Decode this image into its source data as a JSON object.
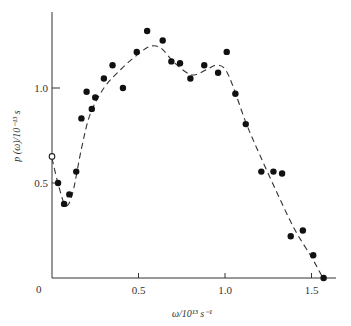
{
  "chart_data": {
    "type": "scatter",
    "title": "",
    "xlabel": "ω/10¹³ s⁻¹",
    "ylabel": "p (ω)/10⁻¹³ s",
    "xlim": [
      0,
      1.6
    ],
    "ylim": [
      0,
      1.35
    ],
    "x_ticks": [
      0.5,
      1.0,
      1.5
    ],
    "x_tick_labels": [
      "0.5",
      "1.0",
      "1.5"
    ],
    "y_ticks": [
      0.5,
      1.0
    ],
    "y_tick_labels": [
      "0.5",
      "1.0"
    ],
    "origin_label": "0",
    "grid": false,
    "legend": null,
    "series": [
      {
        "name": "measured (filled)",
        "style": "filled-circle",
        "points": [
          [
            0.035,
            0.5
          ],
          [
            0.07,
            0.39
          ],
          [
            0.1,
            0.44
          ],
          [
            0.14,
            0.56
          ],
          [
            0.17,
            0.84
          ],
          [
            0.2,
            0.98
          ],
          [
            0.23,
            0.89
          ],
          [
            0.25,
            0.95
          ],
          [
            0.3,
            1.05
          ],
          [
            0.35,
            1.12
          ],
          [
            0.41,
            1.0
          ],
          [
            0.49,
            1.19
          ],
          [
            0.55,
            1.3
          ],
          [
            0.64,
            1.25
          ],
          [
            0.69,
            1.14
          ],
          [
            0.74,
            1.13
          ],
          [
            0.8,
            1.05
          ],
          [
            0.88,
            1.12
          ],
          [
            0.96,
            1.08
          ],
          [
            1.01,
            1.19
          ],
          [
            1.06,
            0.97
          ],
          [
            1.12,
            0.81
          ],
          [
            1.21,
            0.56
          ],
          [
            1.28,
            0.56
          ],
          [
            1.33,
            0.55
          ],
          [
            1.38,
            0.22
          ],
          [
            1.45,
            0.25
          ],
          [
            1.51,
            0.12
          ],
          [
            1.57,
            0.0
          ]
        ]
      },
      {
        "name": "open point",
        "style": "open-circle",
        "points": [
          [
            0.0,
            0.64
          ]
        ]
      },
      {
        "name": "fit curve",
        "style": "dashed-line",
        "points": [
          [
            0.0,
            0.63
          ],
          [
            0.04,
            0.48
          ],
          [
            0.08,
            0.38
          ],
          [
            0.12,
            0.45
          ],
          [
            0.17,
            0.68
          ],
          [
            0.22,
            0.86
          ],
          [
            0.3,
            1.0
          ],
          [
            0.4,
            1.1
          ],
          [
            0.5,
            1.18
          ],
          [
            0.57,
            1.22
          ],
          [
            0.63,
            1.21
          ],
          [
            0.7,
            1.14
          ],
          [
            0.78,
            1.08
          ],
          [
            0.83,
            1.07
          ],
          [
            0.9,
            1.1
          ],
          [
            0.95,
            1.12
          ],
          [
            1.0,
            1.1
          ],
          [
            1.05,
            1.0
          ],
          [
            1.12,
            0.82
          ],
          [
            1.2,
            0.65
          ],
          [
            1.3,
            0.45
          ],
          [
            1.4,
            0.26
          ],
          [
            1.5,
            0.11
          ],
          [
            1.56,
            0.01
          ]
        ]
      }
    ]
  }
}
